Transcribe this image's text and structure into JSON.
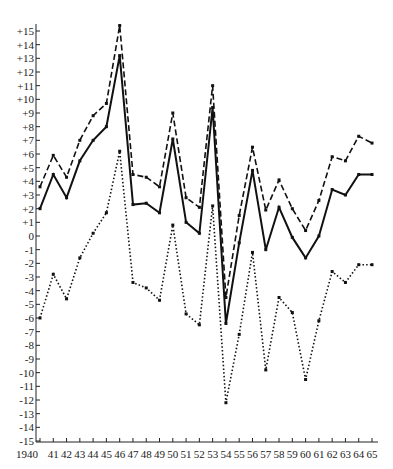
{
  "chart_data": {
    "type": "line",
    "title": "",
    "xlabel": "",
    "ylabel": "",
    "x": [
      "1940",
      "41",
      "42",
      "43",
      "44",
      "45",
      "46",
      "47",
      "48",
      "49",
      "50",
      "51",
      "52",
      "53",
      "54",
      "55",
      "56",
      "57",
      "58",
      "59",
      "60",
      "61",
      "62",
      "63",
      "64",
      "65"
    ],
    "y_ticks": [
      "+15",
      "+14",
      "+13",
      "+12",
      "+11",
      "+10",
      "+9",
      "+8",
      "+7",
      "+6",
      "+5",
      "+4",
      "+3",
      "+2",
      "+1",
      "0",
      "-1",
      "-2",
      "-3",
      "-4",
      "-5",
      "-6",
      "-7",
      "-8",
      "-9",
      "-10",
      "-11",
      "-12",
      "-13",
      "-14",
      "-15"
    ],
    "ylim": [
      -15,
      15
    ],
    "grid": false,
    "legend": "none",
    "series": [
      {
        "name": "dashed",
        "style": "dashed",
        "values": [
          3.6,
          5.9,
          4.3,
          7.0,
          8.8,
          9.7,
          15.4,
          4.5,
          4.3,
          3.6,
          9.0,
          2.8,
          2.1,
          11.0,
          -4.5,
          1.5,
          6.5,
          1.9,
          4.1,
          2.0,
          0.4,
          2.6,
          5.8,
          5.5,
          7.3,
          6.8
        ]
      },
      {
        "name": "solid",
        "style": "solid",
        "values": [
          2.0,
          4.5,
          2.8,
          5.5,
          7.0,
          8.0,
          13.2,
          2.3,
          2.4,
          1.7,
          7.1,
          1.0,
          0.2,
          9.4,
          -6.4,
          -0.5,
          4.8,
          -1.0,
          2.1,
          -0.1,
          -1.6,
          0.0,
          3.4,
          3.0,
          4.5,
          4.5
        ]
      },
      {
        "name": "dotted",
        "style": "dotted",
        "values": [
          -6.0,
          -2.8,
          -4.6,
          -1.6,
          0.2,
          1.7,
          6.2,
          -3.4,
          -3.8,
          -4.7,
          0.8,
          -5.7,
          -6.5,
          2.2,
          -12.2,
          -7.2,
          -1.2,
          -9.8,
          -4.5,
          -5.6,
          -10.5,
          -6.2,
          -2.6,
          -3.4,
          -2.1,
          -2.1
        ]
      }
    ],
    "colors": {
      "line": "#111111",
      "axis": "#222222",
      "background": "#ffffff"
    }
  }
}
